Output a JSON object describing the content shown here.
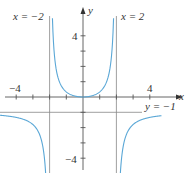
{
  "chart_data": {
    "type": "line",
    "title": "",
    "function": "y = x^2 / (4 - x^2)",
    "xlabel": "x",
    "ylabel": "y",
    "xlim": [
      -5,
      6
    ],
    "ylim": [
      -5,
      6
    ],
    "grid": false,
    "x_ticks": [
      -4,
      -3,
      -2,
      -1,
      0,
      1,
      2,
      3,
      4
    ],
    "y_ticks": [
      -4,
      -3,
      -2,
      -1,
      1,
      2,
      3,
      4
    ],
    "x_tick_labels": [
      {
        "value": -4,
        "text": "−4"
      },
      {
        "value": 4,
        "text": "4"
      }
    ],
    "y_tick_labels": [
      {
        "value": 4,
        "text": "4"
      },
      {
        "value": -4,
        "text": "−4"
      }
    ],
    "asymptotes": [
      {
        "type": "vertical",
        "value": -2,
        "label": "x = −2"
      },
      {
        "type": "vertical",
        "value": 2,
        "label": "x = 2"
      },
      {
        "type": "horizontal",
        "value": -1,
        "label": "y = −1"
      }
    ],
    "series": [
      {
        "name": "left branch",
        "x": [
          -5,
          -4,
          -3,
          -2.5,
          -2.2
        ],
        "y": [
          -1.19,
          -1.33,
          -1.8,
          -2.78,
          -5.76
        ]
      },
      {
        "name": "middle branch",
        "x": [
          -1.8,
          -1.5,
          -1,
          -0.5,
          0,
          0.5,
          1,
          1.5,
          1.8
        ],
        "y": [
          4.26,
          1.29,
          0.33,
          0.07,
          0,
          0.07,
          0.33,
          1.29,
          4.26
        ]
      },
      {
        "name": "right branch",
        "x": [
          2.2,
          2.5,
          3,
          4,
          5
        ],
        "y": [
          -5.76,
          -2.78,
          -1.8,
          -1.33,
          -1.19
        ]
      }
    ],
    "curve_color": "#5aa7d6",
    "axis_color": "#555555",
    "asymptote_color": "#888888"
  },
  "labels": {
    "x_axis": "x",
    "y_axis": "y",
    "asym_left": "x = −2",
    "asym_right": "x = 2",
    "asym_horizontal": "y = −1",
    "tick_x_neg4": "−4",
    "tick_x_4": "4",
    "tick_y_4": "4",
    "tick_y_neg4": "−4"
  }
}
